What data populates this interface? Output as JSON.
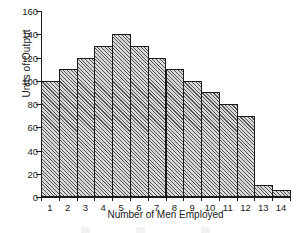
{
  "chart_data": {
    "type": "bar",
    "title": "",
    "xlabel": "Number of Men Employed",
    "ylabel": "Units of Output",
    "categories": [
      "1",
      "2",
      "3",
      "4",
      "5",
      "6",
      "7",
      "8",
      "9",
      "10",
      "11",
      "12",
      "13",
      "14"
    ],
    "values": [
      100,
      110,
      120,
      130,
      140,
      130,
      120,
      110,
      100,
      90,
      80,
      70,
      10,
      6
    ],
    "ylim": [
      0,
      160
    ],
    "yticks": [
      0,
      20,
      40,
      60,
      80,
      100,
      120,
      140,
      160
    ],
    "ytick_labels": [
      "0",
      "20",
      "40",
      "60",
      "80",
      "100",
      "120",
      "140",
      "160"
    ],
    "grid": false,
    "legend": false,
    "bar_fill_color": "#d8d8d8",
    "bar_edge_color": "#1a1a1a",
    "bar_hatch": "diagonal-lines",
    "background_color": "#ffffff",
    "axis_color": "#1a1a1a"
  }
}
